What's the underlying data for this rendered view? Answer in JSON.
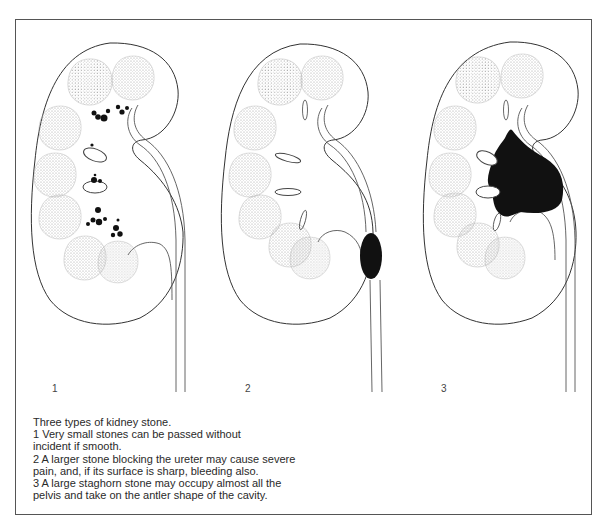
{
  "figure": {
    "panels": [
      {
        "number": "1",
        "description": "kidney with many very small stones in calyces"
      },
      {
        "number": "2",
        "description": "kidney with larger stone blocking the ureter"
      },
      {
        "number": "3",
        "description": "kidney with large staghorn stone filling the pelvis"
      }
    ],
    "caption": {
      "title": "Three types of kidney stone.",
      "lines": [
        "1  Very small stones can be passed without",
        "incident if smooth.",
        "2  A larger stone blocking the ureter may cause severe",
        "pain, and, if its surface is sharp, bleeding also.",
        "3  A large staghorn stone may occupy almost all the",
        "pelvis and take on the antler shape of the cavity."
      ]
    },
    "colors": {
      "frame": "#555555",
      "outline": "#333333",
      "stone": "#111111",
      "pyramid_dots": "#9a9a9a"
    }
  }
}
